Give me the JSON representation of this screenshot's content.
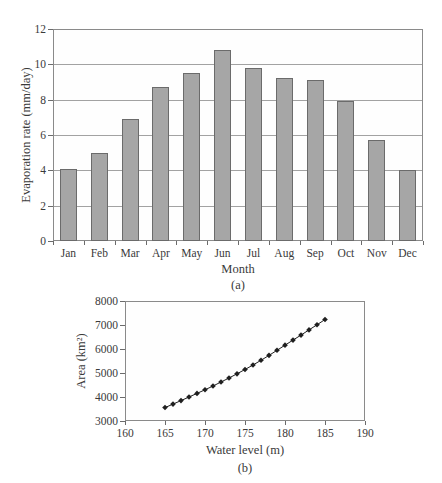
{
  "figure": {
    "background": "#ffffff",
    "text_color": "#3a3a3a",
    "axis_line_color": "#8a8a8a"
  },
  "chart_data": [
    {
      "type": "bar",
      "title": "",
      "categories": [
        "Jan",
        "Feb",
        "Mar",
        "Apr",
        "May",
        "Jun",
        "Jul",
        "Aug",
        "Sep",
        "Oct",
        "Nov",
        "Dec"
      ],
      "values": [
        4.1,
        5.0,
        6.9,
        8.7,
        9.5,
        10.8,
        9.8,
        9.25,
        9.1,
        7.9,
        5.7,
        4.0
      ],
      "xlabel": "Month",
      "ylabel": "Evaporation rate (mm/day)",
      "caption": "(a)",
      "ylim": [
        0,
        12
      ],
      "yticks": [
        0,
        2,
        4,
        6,
        8,
        10,
        12
      ],
      "grid": true,
      "legend": "none",
      "bar_fill": "#a6a6a6",
      "bar_border": "#6b6b6b"
    },
    {
      "type": "line",
      "title": "",
      "x": [
        165,
        166,
        167,
        168,
        169,
        170,
        171,
        172,
        173,
        174,
        175,
        176,
        177,
        178,
        179,
        180,
        181,
        182,
        183,
        184,
        185
      ],
      "y": [
        3560,
        3705,
        3850,
        4000,
        4150,
        4300,
        4460,
        4625,
        4790,
        4965,
        5145,
        5335,
        5530,
        5735,
        5945,
        6160,
        6370,
        6580,
        6795,
        7010,
        7230
      ],
      "xlabel": "Water level (m)",
      "ylabel": "Area (km²)",
      "caption": "(b)",
      "xlim": [
        160,
        190
      ],
      "xticks": [
        160,
        165,
        170,
        175,
        180,
        185,
        190
      ],
      "ylim": [
        3000,
        8000
      ],
      "yticks": [
        3000,
        4000,
        5000,
        6000,
        7000,
        8000
      ],
      "grid": false,
      "legend": "none",
      "marker": "diamond",
      "line_color": "#1f1f1f"
    }
  ]
}
